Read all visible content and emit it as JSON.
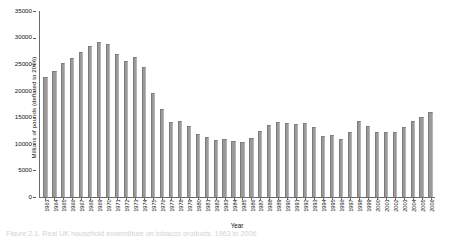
{
  "chart_data": {
    "type": "bar",
    "title": "",
    "xlabel": "Year",
    "ylabel": "Millions of pounds (deflated to 2006)",
    "ylim": [
      0,
      35000
    ],
    "ytick_labels": [
      "0",
      "5000",
      "10000",
      "15000",
      "20000",
      "25000",
      "30000",
      "35000"
    ],
    "ytick_values": [
      0,
      5000,
      10000,
      15000,
      20000,
      25000,
      30000,
      35000
    ],
    "grid": false,
    "legend": null,
    "bar_color": "#9a9a9a",
    "categories": [
      "1963",
      "1964",
      "1965",
      "1966",
      "1967",
      "1968",
      "1969",
      "1970",
      "1971",
      "1972",
      "1973",
      "1974",
      "1975",
      "1976",
      "1977",
      "1978",
      "1979",
      "1980",
      "1981",
      "1982",
      "1983",
      "1984",
      "1985",
      "1986",
      "1987",
      "1988",
      "1989",
      "1990",
      "1991",
      "1992",
      "1993",
      "1994",
      "1995",
      "1996",
      "1997",
      "1998",
      "1999",
      "2000",
      "2001",
      "2002",
      "2003",
      "2004",
      "2005",
      "2006"
    ],
    "values": [
      22500,
      23700,
      25200,
      26200,
      27300,
      28400,
      29100,
      28700,
      26900,
      25600,
      26300,
      24500,
      19600,
      16500,
      14100,
      14300,
      13300,
      11900,
      11300,
      10700,
      11000,
      10500,
      10400,
      11100,
      12400,
      13600,
      14100,
      14000,
      13700,
      13900,
      13100,
      11500,
      11600,
      11000,
      12200,
      14300,
      13400,
      12300,
      12200,
      12200,
      13200,
      14300,
      15100,
      16000
    ]
  },
  "caption": {
    "text": "Figure 2.1. Real UK household expenditure on tobacco products, 1963 to 2006"
  }
}
